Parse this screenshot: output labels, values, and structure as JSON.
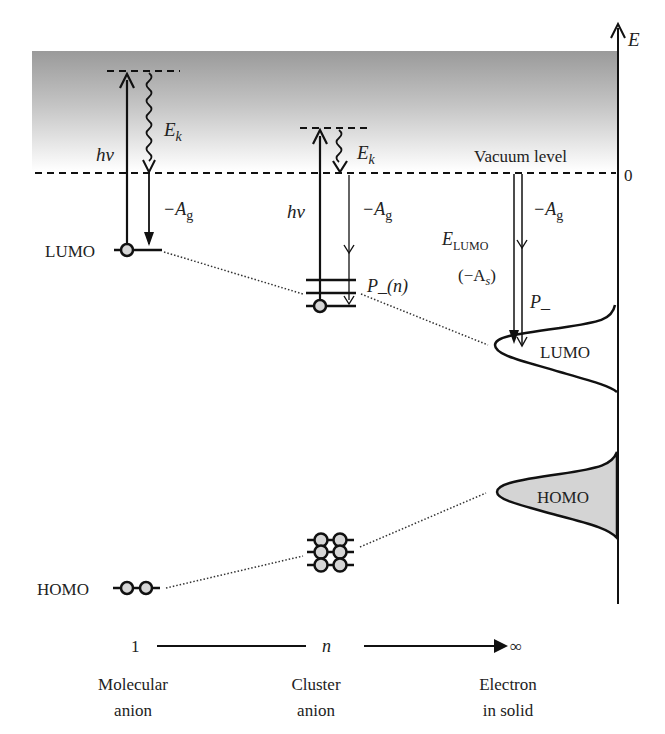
{
  "axis": {
    "energy_label": "E",
    "zero_label": "0",
    "vacuum_level_label": "Vacuum level"
  },
  "molecular": {
    "hv": "hv",
    "ek_main": "E",
    "ek_sub": "k",
    "ag_main": "−A",
    "ag_sub": "g",
    "lumo_label": "LUMO",
    "homo_label": "HOMO"
  },
  "cluster": {
    "hv": "hv",
    "ek_main": "E",
    "ek_sub": "k",
    "ag_main": "−A",
    "ag_sub": "g",
    "polarization_label": "P_(n)"
  },
  "solid": {
    "ag_main": "−A",
    "ag_sub": "g",
    "elumo_main": "E",
    "elumo_sub": "LUMO",
    "as_open": "(−A",
    "as_sub": "s",
    "as_close": ")",
    "p_label": "P_",
    "lumo_band_label": "LUMO",
    "homo_band_label": "HOMO"
  },
  "size_axis": {
    "start": "1",
    "middle": "n",
    "end": "∞",
    "categories": [
      {
        "line1": "Molecular",
        "line2": "anion"
      },
      {
        "line1": "Cluster",
        "line2": "anion"
      },
      {
        "line1": "Electron",
        "line2": "in solid"
      }
    ]
  },
  "colors": {
    "continuum_top": "#9a9a9a",
    "continuum_bottom": "#ffffff",
    "orbital_fill": "#d6d6d6",
    "homo_band_fill": "#d4d4d4",
    "line": "#111111"
  }
}
